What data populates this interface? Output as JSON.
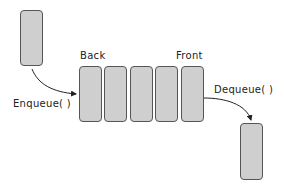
{
  "labels": {
    "back": "Back",
    "front": "Front",
    "enqueue": "Enqueue( )",
    "dequeue": "Dequeue( )"
  },
  "queue": {
    "slots": 5
  },
  "colors": {
    "box_fill": "#cfcfcf",
    "box_border": "#555555",
    "arrow": "#222222"
  }
}
